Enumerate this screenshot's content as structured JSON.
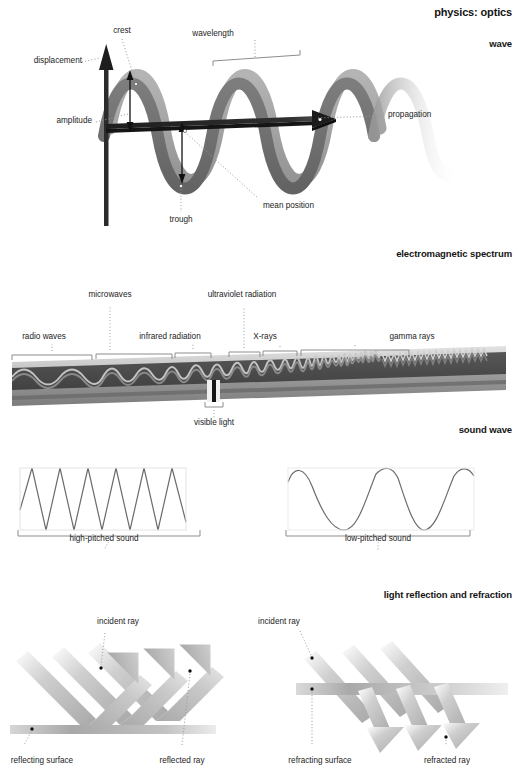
{
  "document": {
    "title": "physics: optics",
    "background": "#ffffff",
    "width": 520,
    "height": 773
  },
  "sections": [
    {
      "id": "wave",
      "header": "wave"
    },
    {
      "id": "em-spectrum",
      "header": "electromagnetic spectrum"
    },
    {
      "id": "sound-wave",
      "header": "sound wave"
    },
    {
      "id": "reflection-refraction",
      "header": "light reflection and refraction"
    }
  ],
  "wave_diagram": {
    "labels": {
      "crest": "crest",
      "wavelength": "wavelength",
      "displacement": "displacement",
      "amplitude": "amplitude",
      "propagation": "propagation",
      "mean_position": "mean position",
      "trough": "trough"
    }
  },
  "em_spectrum": {
    "bands": [
      {
        "name": "radio waves",
        "label_x": 44,
        "bracket": [
          12,
          92
        ]
      },
      {
        "name": "microwaves",
        "label_x": 110,
        "bracket": [
          96,
          172
        ]
      },
      {
        "name": "infrared radiation",
        "label_x": 168,
        "bracket": [
          175,
          211
        ]
      },
      {
        "name": "ultraviolet radiation",
        "label_x": 240,
        "bracket": [
          229,
          260
        ]
      },
      {
        "name": "X-rays",
        "label_x": 263,
        "bracket": [
          263,
          297
        ]
      },
      {
        "name": "gamma rays",
        "label_x": 412,
        "bracket": [
          301,
          409
        ]
      }
    ],
    "visible_light": "visible light"
  },
  "sound_wave": {
    "high": {
      "label": "high-pitched sound",
      "cycles": 7
    },
    "low": {
      "label": "low-pitched sound",
      "cycles": 2.5
    }
  },
  "reflection": {
    "incident_ray": "incident ray",
    "reflected_ray": "reflected ray",
    "reflecting_surface": "reflecting surface"
  },
  "refraction": {
    "incident_ray": "incident ray",
    "refracted_ray": "refracted ray",
    "refracting_surface": "refracting surface"
  },
  "colors": {
    "wave_ribbon_dark": "#6e6e6e",
    "wave_ribbon_light": "#b9b9b9",
    "axis_dark": "#2b2b2b",
    "spectrum_base": "#8d8d8d",
    "spectrum_top": "#d9d9d9",
    "ray_gray": "#b4b4b4",
    "surface_gray": "#bdbdbd",
    "leader": "#9a9a9a",
    "text": "#1c1c1c"
  }
}
